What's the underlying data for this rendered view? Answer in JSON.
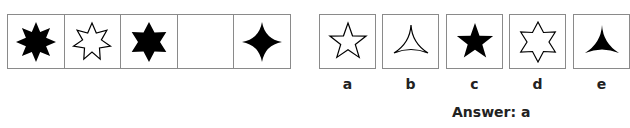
{
  "sequence": {
    "cells": [
      {
        "shape": "eight-point-star",
        "fill": "#000000"
      },
      {
        "shape": "seven-point-star",
        "fill": "none"
      },
      {
        "shape": "six-point-star",
        "fill": "#000000"
      },
      {
        "shape": "empty",
        "fill": "none"
      },
      {
        "shape": "four-point-star",
        "fill": "#000000"
      }
    ]
  },
  "options": [
    {
      "label": "a",
      "shape": "five-point-star",
      "fill": "none"
    },
    {
      "label": "b",
      "shape": "three-point-star",
      "fill": "none"
    },
    {
      "label": "c",
      "shape": "five-point-star",
      "fill": "#000000"
    },
    {
      "label": "d",
      "shape": "six-point-star",
      "fill": "none"
    },
    {
      "label": "e",
      "shape": "three-point-star",
      "fill": "#000000"
    }
  ],
  "answer": {
    "text": "Answer: a"
  }
}
